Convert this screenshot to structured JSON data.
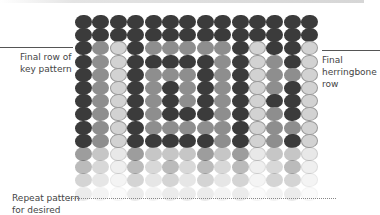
{
  "labels": {
    "left_top": "Final row of\nkey pattern",
    "right": "Final\nherringbone\nrow",
    "left_bottom": "Repeat pattern\nfor desired"
  },
  "colors": {
    "dark": "#3b3b3b",
    "medium": "#8e8e8e",
    "light": "#d2d2d2",
    "background": "#ffffff"
  },
  "grid": {
    "columns": 14,
    "rows": [
      {
        "beads": "DDDDDDDDDDDDDD",
        "opacity": 1
      },
      {
        "beads": "DDDDDDDDDDDDDD",
        "opacity": 1
      },
      {
        "beads": "DMLDMMMMMDLDDL",
        "opacity": 1
      },
      {
        "beads": "DMLDDDDDMDLMDL",
        "opacity": 1
      },
      {
        "beads": "DMLDMMMDMDLMML",
        "opacity": 1
      },
      {
        "beads": "DMLDMDMDMDLMDL",
        "opacity": 1
      },
      {
        "beads": "DMLDMDMDMDLDDL",
        "opacity": 1
      },
      {
        "beads": "DMLDMDDDMDLMDL",
        "opacity": 1
      },
      {
        "beads": "DMLDMMMMMDLMML",
        "opacity": 1
      },
      {
        "beads": "DMLDDDDDMDLMDL",
        "opacity": 1
      },
      {
        "beads": "DMLDMMMDMDLMML",
        "opacity": 0.5
      },
      {
        "beads": "DMLDMDMDMDLMDL",
        "opacity": 0.35
      },
      {
        "beads": "DMLDMDMDMDLDDL",
        "opacity": 0.22
      },
      {
        "beads": "DMLDMDDDMDLMDL",
        "opacity": 0.1
      }
    ]
  }
}
